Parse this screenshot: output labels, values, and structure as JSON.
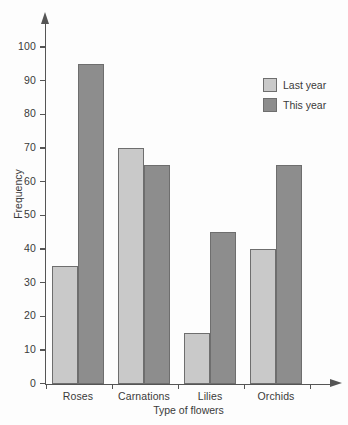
{
  "chart_data": {
    "type": "bar",
    "title": "",
    "xlabel": "Type of flowers",
    "ylabel": "Frequency",
    "categories": [
      "Roses",
      "Carnations",
      "Lilies",
      "Orchids"
    ],
    "series": [
      {
        "name": "Last year",
        "color": "#c9c9c9",
        "values": [
          35,
          70,
          15,
          40
        ]
      },
      {
        "name": "This year",
        "color": "#8d8d8d",
        "values": [
          95,
          65,
          45,
          65
        ]
      }
    ],
    "ylim": [
      0,
      100
    ],
    "ytick_labels": [
      "0",
      "10",
      "20",
      "30",
      "40",
      "50",
      "60",
      "70",
      "80",
      "90",
      "100"
    ],
    "ytick_values": [
      0,
      10,
      20,
      30,
      40,
      50,
      60,
      70,
      80,
      90,
      100
    ],
    "grid": false,
    "legend_position": "top-right",
    "axis_style": "arrow-tipped"
  },
  "axes": {
    "y_title": "Frequency",
    "x_title": "Type of flowers"
  },
  "legend": {
    "items": [
      {
        "label": "Last year",
        "color": "#c9c9c9"
      },
      {
        "label": "This year",
        "color": "#8d8d8d"
      }
    ]
  }
}
